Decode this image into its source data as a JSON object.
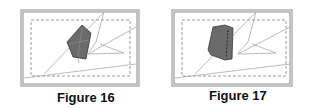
{
  "figures": [
    {
      "id": "figure-16",
      "caption": "Figure 16",
      "frame": {
        "x": 21,
        "y": 10,
        "w": 118,
        "h": 76
      },
      "inner_dashed": {
        "x": 31,
        "y": 20,
        "w": 99,
        "h": 56
      },
      "shape": {
        "type": "pentagon",
        "fill": "#6b6b6b",
        "points": [
          [
            82,
            25
          ],
          [
            91,
            33
          ],
          [
            86,
            59
          ],
          [
            73,
            57
          ],
          [
            67,
            42
          ]
        ]
      },
      "lines": [
        [
          [
            24,
            78
          ],
          [
            136,
            64
          ]
        ],
        [
          [
            44,
            74
          ],
          [
            104,
            12
          ]
        ],
        [
          [
            104,
            12
          ],
          [
            96,
            42
          ]
        ],
        [
          [
            96,
            42
          ],
          [
            89,
            52
          ]
        ],
        [
          [
            88,
            54
          ],
          [
            136,
            27
          ]
        ],
        [
          [
            88,
            54
          ],
          [
            124,
            53
          ]
        ],
        [
          [
            124,
            53
          ],
          [
            100,
            44
          ]
        ]
      ]
    },
    {
      "id": "figure-17",
      "caption": "Figure 17",
      "frame": {
        "x": 172,
        "y": 10,
        "w": 120,
        "h": 76
      },
      "inner_dashed": {
        "x": 182,
        "y": 20,
        "w": 104,
        "h": 56
      },
      "shape": {
        "type": "trapezoid",
        "fill": "#6b6b6b",
        "points": [
          [
            213,
            27
          ],
          [
            225,
            25
          ],
          [
            233,
            28
          ],
          [
            232,
            59
          ],
          [
            225,
            60
          ],
          [
            211,
            55
          ],
          [
            208,
            50
          ]
        ]
      },
      "lines": [
        [
          [
            175,
            78
          ],
          [
            290,
            64
          ]
        ],
        [
          [
            195,
            74
          ],
          [
            256,
            12
          ]
        ],
        [
          [
            256,
            12
          ],
          [
            248,
            42
          ]
        ],
        [
          [
            248,
            42
          ],
          [
            238,
            53
          ]
        ],
        [
          [
            238,
            54
          ],
          [
            290,
            27
          ]
        ],
        [
          [
            238,
            54
          ],
          [
            276,
            53
          ]
        ],
        [
          [
            276,
            53
          ],
          [
            252,
            44
          ]
        ]
      ]
    }
  ],
  "colors": {
    "frame": "#8a8a8a",
    "dashed": "#9a9a9a",
    "lines": "#a8a8a8",
    "shape_fill": "#6b6b6b",
    "shape_stroke": "#3a3a3a",
    "caption": "#111111"
  }
}
